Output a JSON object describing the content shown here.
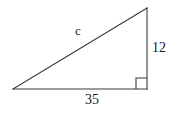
{
  "figure": {
    "type": "right-triangle-diagram",
    "background_color": "#ffffff",
    "stroke_color": "#3a3a3a",
    "text_color": "#1a1a1a",
    "stroke_width": 1.1,
    "vertices": {
      "left": {
        "x": 13,
        "y": 89
      },
      "top_right": {
        "x": 147,
        "y": 8
      },
      "bottom_right": {
        "x": 147,
        "y": 89
      }
    },
    "right_angle_marker": {
      "name": "right-angle-square",
      "x": 136,
      "y": 78,
      "size": 11
    },
    "labels": {
      "hypotenuse": "c",
      "vertical_leg": "12",
      "horizontal_leg": "35"
    }
  }
}
